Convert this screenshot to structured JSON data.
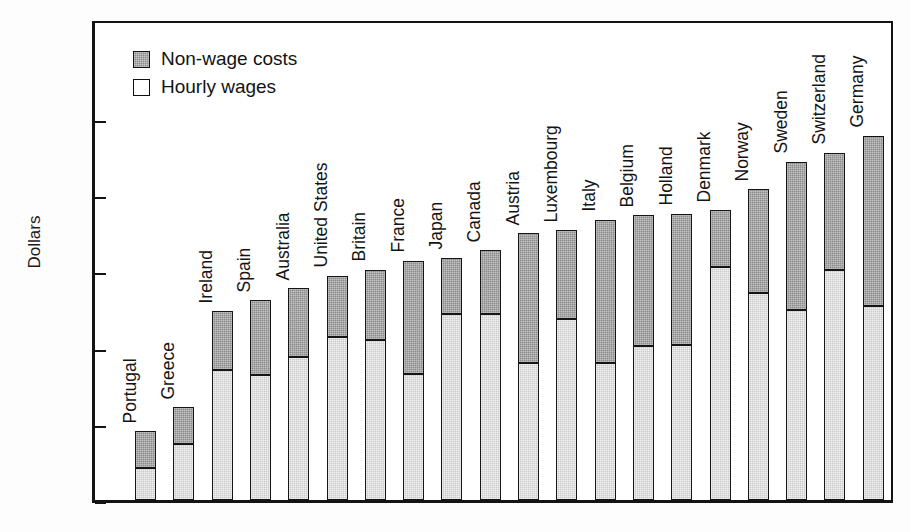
{
  "chart_data": {
    "type": "bar",
    "subtype": "stacked-vertical",
    "title": "",
    "xlabel": "",
    "ylabel": "Dollars",
    "ylim": [
      0,
      29.2
    ],
    "yticks": [
      0,
      5,
      10,
      15,
      20,
      25
    ],
    "ytick_labels": [
      "0",
      "5",
      "10",
      "15",
      "20",
      "25"
    ],
    "grid": false,
    "legend_position": "upper-left inside plot area",
    "categories": [
      "Portugal",
      "Greece",
      "Ireland",
      "Spain",
      "Australia",
      "United States",
      "Britain",
      "France",
      "Japan",
      "Canada",
      "Austria",
      "Luxembourg",
      "Italy",
      "Belgium",
      "Holland",
      "Denmark",
      "Norway",
      "Sweden",
      "Switzerland",
      "Germany"
    ],
    "series": [
      {
        "name": "Hourly wages",
        "color": "#c9c9c9",
        "values": [
          2.1,
          3.7,
          8.5,
          8.2,
          9.4,
          10.7,
          10.5,
          8.3,
          12.2,
          12.2,
          9.0,
          11.9,
          9.0,
          10.1,
          10.2,
          15.3,
          13.6,
          12.5,
          15.1,
          12.7
        ]
      },
      {
        "name": "Non-wage costs",
        "color": "#8b8b8b",
        "values": [
          2.4,
          2.4,
          3.9,
          4.9,
          4.5,
          4.0,
          4.6,
          7.4,
          3.7,
          4.2,
          8.5,
          5.8,
          9.4,
          8.6,
          8.6,
          3.7,
          6.8,
          9.7,
          7.7,
          11.2
        ]
      }
    ],
    "totals": [
      4.5,
      6.1,
      12.4,
      13.1,
      13.9,
      14.7,
      15.1,
      15.7,
      15.9,
      16.4,
      17.5,
      17.7,
      18.4,
      18.7,
      18.8,
      19.0,
      20.4,
      22.2,
      22.8,
      23.9
    ]
  },
  "legend": {
    "items": [
      {
        "label": "Non-wage costs",
        "swatch": "dark-gray-filled"
      },
      {
        "label": "Hourly wages",
        "swatch": "white-empty"
      }
    ]
  },
  "colors": {
    "non_wage": "#8b8b8b",
    "hourly_wage": "#c9c9c9",
    "axis": "#141414",
    "background": "#ffffff"
  }
}
